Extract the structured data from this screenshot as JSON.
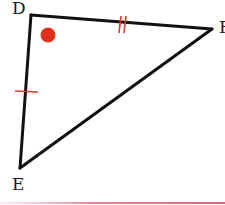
{
  "diagram": {
    "type": "triangle",
    "vertices": [
      {
        "name": "D",
        "x": 31,
        "y": 15
      },
      {
        "name": "F",
        "x": 212,
        "y": 29
      },
      {
        "name": "E",
        "x": 20,
        "y": 168
      }
    ],
    "labels": {
      "D": "D",
      "E": "E",
      "F": "F"
    },
    "markings": {
      "DF": {
        "tick_count": 2,
        "color": "#d93a2b"
      },
      "DE": {
        "tick_count": 1,
        "color": "#d93a2b"
      }
    },
    "angle_marker": {
      "vertex": "D",
      "shape": "dot",
      "color": "#e0301e"
    },
    "colors": {
      "stroke": "#111111",
      "tick": "#d93a2b",
      "dot": "#e0301e",
      "bottom_rule": "#e07a86"
    }
  }
}
